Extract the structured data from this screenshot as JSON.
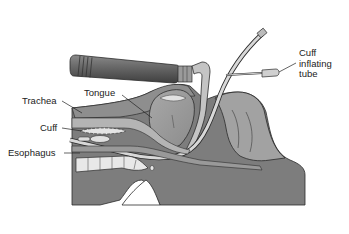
{
  "figure": {
    "colors": {
      "background": "#ffffff",
      "tissue_dark": "#7a7a7a",
      "tissue_mid": "#9a9a9a",
      "tissue_light": "#bdbdbd",
      "highlight": "#e6e6e6",
      "outline": "#2b2b2b",
      "leader_line": "#222222"
    },
    "labels": {
      "tongue": "Tongue",
      "trachea": "Trachea",
      "cuff": "Cuff",
      "esophagus": "Esophagus",
      "cuff_inflating_tube_line1": "Cuff",
      "cuff_inflating_tube_line2": "inflating",
      "cuff_inflating_tube_line3": "tube"
    }
  }
}
